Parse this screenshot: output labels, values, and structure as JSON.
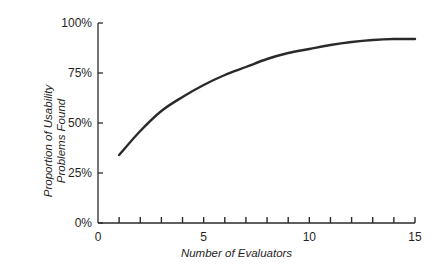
{
  "chart_data": {
    "type": "line",
    "title": "",
    "xlabel": "Number of Evaluators",
    "ylabel": [
      "Proportion of Usability",
      "Problems Found"
    ],
    "xlim": [
      0,
      15
    ],
    "ylim": [
      0,
      100
    ],
    "x_ticks": [
      0,
      5,
      10,
      15
    ],
    "x_minor_ticks": [
      1,
      2,
      3,
      4,
      5,
      6,
      7,
      8,
      9,
      10,
      11,
      12,
      13,
      14,
      15
    ],
    "y_ticks": [
      0,
      25,
      50,
      75,
      100
    ],
    "y_tick_labels": [
      "0%",
      "25%",
      "50%",
      "75%",
      "100%"
    ],
    "x_tick_labels": [
      "0",
      "5",
      "10",
      "15"
    ],
    "grid": false,
    "legend": null,
    "series": [
      {
        "name": "Proportion of Usability Problems Found",
        "color": "#2a2a2a",
        "x": [
          1,
          2,
          3,
          4,
          5,
          6,
          7,
          8,
          9,
          10,
          11,
          12,
          13,
          14,
          15
        ],
        "values": [
          34,
          46,
          56,
          63,
          69,
          74,
          78,
          82,
          85,
          87,
          89,
          90.5,
          91.5,
          92,
          92
        ]
      }
    ]
  }
}
